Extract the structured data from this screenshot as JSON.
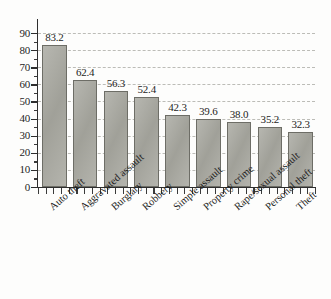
{
  "chart_data": {
    "type": "bar",
    "title": "",
    "subtitle": "",
    "xlabel": "",
    "ylabel": "",
    "categories": [
      "Auto theft",
      "Aggravated assault",
      "Burglary",
      "Robbery",
      "Simple assault",
      "Property crime",
      "Rape/sexual assault",
      "Personal theft",
      "Theft"
    ],
    "values": [
      83.2,
      62.4,
      56.3,
      52.4,
      42.3,
      39.6,
      38.0,
      35.2,
      32.3
    ],
    "value_labels": [
      "83.2",
      "62.4",
      "56.3",
      "52.4",
      "42.3",
      "39.6",
      "38.0",
      "35.2",
      "32.3"
    ],
    "ylim": [
      0,
      90
    ],
    "ytick_labels": [
      "0",
      "10",
      "20",
      "30",
      "40",
      "50",
      "60",
      "70",
      "80",
      "90"
    ],
    "ytick_values": [
      0,
      10,
      20,
      30,
      40,
      50,
      60,
      70,
      80,
      90
    ],
    "grid": "horizontal-dashed",
    "legend": "none",
    "bar_color": "#a9a9a1",
    "bar_border_color": "#6d6d66",
    "gridline_color": "#b9b9b4",
    "axis_color": "#2e2e2e",
    "text_color": "#1d1d1d",
    "background_color": "#fdfdfc",
    "xtick_label_rotation": -41
  }
}
